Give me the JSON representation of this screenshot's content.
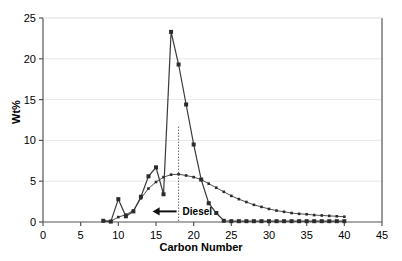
{
  "chart_data": {
    "type": "line",
    "title": "",
    "subtitle": "",
    "xlabel": "Carbon Number",
    "ylabel": "Wt%",
    "xlim": [
      0,
      45
    ],
    "ylim": [
      0,
      25
    ],
    "xticks": [
      0,
      5,
      10,
      15,
      20,
      25,
      30,
      35,
      40,
      45
    ],
    "yticks": [
      0,
      5,
      10,
      15,
      20,
      25
    ],
    "grid": "horizontal",
    "legend": "none",
    "series": [
      {
        "name": "narrow-distribution",
        "marker": "square",
        "x": [
          8,
          9,
          10,
          11,
          12,
          13,
          14,
          15,
          16,
          17,
          18,
          19,
          20,
          21,
          22,
          23,
          24,
          25,
          26,
          27,
          28,
          29,
          30,
          31,
          32,
          33,
          34,
          35,
          36,
          37,
          38,
          39,
          40
        ],
        "values": [
          0.15,
          0.05,
          2.8,
          0.7,
          1.3,
          3.1,
          5.6,
          6.7,
          3.4,
          23.3,
          19.3,
          14.4,
          9.5,
          5.2,
          2.3,
          1.1,
          0.15,
          0.1,
          0.1,
          0.1,
          0.1,
          0.1,
          0.1,
          0.1,
          0.1,
          0.1,
          0.1,
          0.1,
          0.1,
          0.1,
          0.1,
          0.1,
          0.1
        ]
      },
      {
        "name": "broad-distribution",
        "marker": "small-square",
        "x": [
          8,
          9,
          10,
          11,
          12,
          13,
          14,
          15,
          16,
          17,
          18,
          19,
          20,
          21,
          22,
          23,
          24,
          25,
          26,
          27,
          28,
          29,
          30,
          31,
          32,
          33,
          34,
          35,
          36,
          37,
          38,
          39,
          40
        ],
        "values": [
          0.15,
          0.1,
          0.6,
          0.9,
          1.4,
          2.9,
          4.1,
          4.9,
          5.5,
          5.8,
          5.85,
          5.7,
          5.5,
          5.2,
          4.7,
          4.2,
          3.7,
          3.2,
          2.8,
          2.45,
          2.1,
          1.85,
          1.6,
          1.4,
          1.25,
          1.1,
          1.0,
          0.95,
          0.85,
          0.8,
          0.75,
          0.7,
          0.65
        ]
      }
    ],
    "annotations": [
      {
        "name": "diesel-marker",
        "label": "Diesel",
        "arrow": "left",
        "x_position": 18,
        "y_position": 1.3,
        "vline_x": 18,
        "vline_top_y": 11.7,
        "vline_bottom_y": 0
      }
    ]
  }
}
